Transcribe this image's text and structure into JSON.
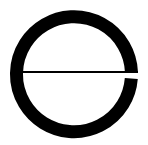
{
  "image": {
    "description": "Letter-e style ring symbol",
    "icon": "e-ring-icon",
    "colors": {
      "background": "#ffffff",
      "stroke": "#000000"
    }
  }
}
